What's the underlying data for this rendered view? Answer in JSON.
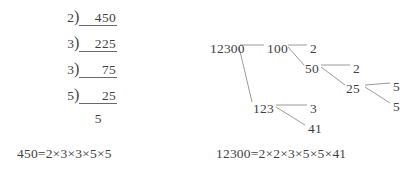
{
  "page": {
    "background": "#ffffff",
    "ink": "#3f3f3f",
    "rule_color": "#6a6a6a"
  },
  "left_panel": {
    "name": "division-ladder-450",
    "method": "repeated division ladder",
    "rows": [
      {
        "divisor": "2",
        "dividend": "450",
        "bracket": ")"
      },
      {
        "divisor": "3",
        "dividend": "225",
        "bracket": ")"
      },
      {
        "divisor": "3",
        "dividend": "75",
        "bracket": ")"
      },
      {
        "divisor": "5",
        "dividend": "25",
        "bracket": ")"
      }
    ],
    "final_quotient": "5",
    "equation": "450=2×3×3×5×5"
  },
  "right_panel": {
    "name": "factor-tree-12300",
    "method": "factor tree",
    "nodes": [
      {
        "id": "n12300",
        "label": "12300",
        "x": 0,
        "y": 8
      },
      {
        "id": "n100",
        "label": "100",
        "x": 57,
        "y": 8
      },
      {
        "id": "n2a",
        "label": "2",
        "x": 100,
        "y": 8
      },
      {
        "id": "n50",
        "label": "50",
        "x": 95,
        "y": 28
      },
      {
        "id": "n2b",
        "label": "2",
        "x": 143,
        "y": 28
      },
      {
        "id": "n25",
        "label": "25",
        "x": 136,
        "y": 48
      },
      {
        "id": "n5a",
        "label": "5",
        "x": 183,
        "y": 46
      },
      {
        "id": "n5b",
        "label": "5",
        "x": 183,
        "y": 66
      },
      {
        "id": "n123",
        "label": "123",
        "x": 43,
        "y": 68
      },
      {
        "id": "n3",
        "label": "3",
        "x": 100,
        "y": 68
      },
      {
        "id": "n41",
        "label": "41",
        "x": 98,
        "y": 88
      }
    ],
    "edges": [
      {
        "from": "n12300",
        "to": "n100",
        "x1": 30,
        "y1": 11,
        "x2": 54,
        "y2": 11
      },
      {
        "from": "n12300",
        "to": "n123",
        "x1": 29,
        "y1": 13,
        "x2": 42,
        "y2": 68
      },
      {
        "from": "n100",
        "to": "n2a",
        "x1": 78,
        "y1": 11,
        "x2": 97,
        "y2": 11
      },
      {
        "from": "n100",
        "to": "n50",
        "x1": 78,
        "y1": 13,
        "x2": 94,
        "y2": 31
      },
      {
        "from": "n50",
        "to": "n2b",
        "x1": 111,
        "y1": 31,
        "x2": 140,
        "y2": 31
      },
      {
        "from": "n50",
        "to": "n25",
        "x1": 111,
        "y1": 33,
        "x2": 135,
        "y2": 51
      },
      {
        "from": "n25",
        "to": "n5a",
        "x1": 155,
        "y1": 51,
        "x2": 180,
        "y2": 49
      },
      {
        "from": "n25",
        "to": "n5b",
        "x1": 155,
        "y1": 53,
        "x2": 180,
        "y2": 69
      },
      {
        "from": "n123",
        "to": "n3",
        "x1": 66,
        "y1": 71,
        "x2": 97,
        "y2": 71
      },
      {
        "from": "n123",
        "to": "n41",
        "x1": 66,
        "y1": 73,
        "x2": 95,
        "y2": 91
      }
    ],
    "equation": "12300=2×2×3×5×5×41"
  }
}
